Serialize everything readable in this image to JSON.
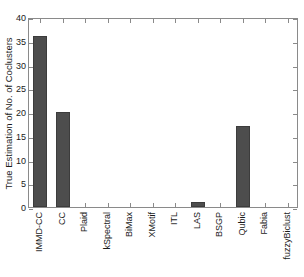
{
  "chart_data": {
    "type": "bar",
    "title": "",
    "xlabel": "",
    "ylabel": "True Estimation of No. of Coclusters",
    "categories": [
      "IMMD-CC",
      "CC",
      "Plaid",
      "kSpectral",
      "BiMax",
      "XMotif",
      "ITL",
      "LAS",
      "BSGP",
      "Qubic",
      "Fabia",
      "fuzzyBiclust"
    ],
    "values": [
      36,
      20,
      0,
      0,
      0,
      0,
      0,
      1,
      0,
      17,
      0,
      0
    ],
    "ylim": [
      0,
      40
    ],
    "yticks": [
      0,
      5,
      10,
      15,
      20,
      25,
      30,
      35,
      40
    ],
    "ytick_labels": [
      "0",
      "5",
      "10",
      "15",
      "20",
      "25",
      "30",
      "35",
      "40"
    ],
    "grid": false,
    "legend": null,
    "bar_color": "#4d4d4d",
    "axis_color": "#8a8a8a",
    "text_color": "#1a1a1a",
    "background": "#ffffff"
  }
}
